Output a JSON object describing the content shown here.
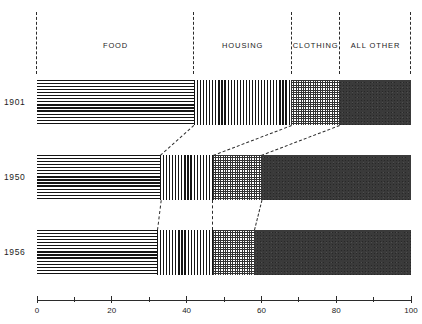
{
  "chart_data": {
    "type": "bar",
    "subtype": "100-percent-stacked-horizontal",
    "title": "",
    "subtitle": "",
    "xlabel": "",
    "ylabel": "",
    "xlim": [
      0,
      100
    ],
    "grid": false,
    "legend_position": "top-as-column-headers",
    "categories": [
      "1901",
      "1950",
      "1956"
    ],
    "series": [
      {
        "name": "FOOD",
        "values": [
          42,
          33,
          32
        ],
        "pattern": "horizontal-lines"
      },
      {
        "name": "HOUSING",
        "values": [
          26,
          14,
          15
        ],
        "pattern": "vertical-lines"
      },
      {
        "name": "CLOTHING",
        "values": [
          13,
          13,
          11
        ],
        "pattern": "crosshatch-grid"
      },
      {
        "name": "ALL OTHER",
        "values": [
          19,
          40,
          42
        ],
        "pattern": "solid-dark"
      }
    ],
    "cumulative_boundaries": {
      "1901": [
        0,
        42,
        68,
        81,
        100
      ],
      "1950": [
        0,
        33,
        47,
        60,
        100
      ],
      "1956": [
        0,
        32,
        47,
        58,
        100
      ]
    },
    "axis": {
      "ticks": [
        0,
        10,
        20,
        30,
        40,
        50,
        60,
        70,
        80,
        90,
        100
      ],
      "labeled_ticks": [
        0,
        20,
        40,
        60,
        80,
        100
      ],
      "tick_labels": [
        "0",
        "20",
        "40",
        "60",
        "80",
        "100"
      ]
    }
  },
  "header": {
    "labels": [
      {
        "text": "FOOD",
        "center_value": 21
      },
      {
        "text": "HOUSING",
        "center_value": 55
      },
      {
        "text": "CLOTHING",
        "center_value": 74.5
      },
      {
        "text": "ALL OTHER",
        "center_value": 90.5
      }
    ],
    "divider_values": [
      0,
      42,
      68,
      81,
      100
    ]
  },
  "rows": [
    {
      "year": "1901",
      "segments": [
        {
          "name": "FOOD",
          "start": 0,
          "end": 42,
          "pattern": "pat-hlines"
        },
        {
          "name": "HOUSING",
          "start": 42,
          "end": 68,
          "pattern": "pat-vlines"
        },
        {
          "name": "CLOTHING",
          "start": 68,
          "end": 81,
          "pattern": "pat-grid"
        },
        {
          "name": "ALL OTHER",
          "start": 81,
          "end": 100,
          "pattern": "pat-solid"
        }
      ]
    },
    {
      "year": "1950",
      "segments": [
        {
          "name": "FOOD",
          "start": 0,
          "end": 33,
          "pattern": "pat-hlines"
        },
        {
          "name": "HOUSING",
          "start": 33,
          "end": 47,
          "pattern": "pat-vlines"
        },
        {
          "name": "CLOTHING",
          "start": 47,
          "end": 60,
          "pattern": "pat-grid"
        },
        {
          "name": "ALL OTHER",
          "start": 60,
          "end": 100,
          "pattern": "pat-solid"
        }
      ]
    },
    {
      "year": "1956",
      "segments": [
        {
          "name": "FOOD",
          "start": 0,
          "end": 32,
          "pattern": "pat-hlines"
        },
        {
          "name": "HOUSING",
          "start": 32,
          "end": 47,
          "pattern": "pat-vlines"
        },
        {
          "name": "CLOTHING",
          "start": 47,
          "end": 58,
          "pattern": "pat-grid"
        },
        {
          "name": "ALL OTHER",
          "start": 58,
          "end": 100,
          "pattern": "pat-solid"
        }
      ]
    }
  ],
  "colors": {
    "ink": "#1c1c1c",
    "rule": "#2b2b2b",
    "solid_fill": "#3a3a3a",
    "background": "#ffffff"
  }
}
